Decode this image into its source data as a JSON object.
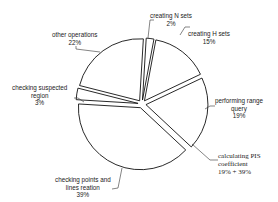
{
  "chart_data": {
    "type": "pie",
    "title": "",
    "style": "exploded, unfilled slices with black outlines",
    "slices": [
      {
        "label": "creating N sets",
        "value": 2,
        "display": "2%"
      },
      {
        "label": "creating H sets",
        "value": 15,
        "display": "15%"
      },
      {
        "label": "performing range query",
        "value": 19,
        "display": "19%"
      },
      {
        "label": "checking points and lines reation",
        "value": 39,
        "display": "39%"
      },
      {
        "label": "checking suspected region",
        "value": 3,
        "display": "3%"
      },
      {
        "label": "other operations",
        "value": 22,
        "display": "22%"
      }
    ],
    "annotations": [
      {
        "text": "calculating PIS coefficient",
        "value_text": "19% + 39%",
        "points_to": "boundary between performing range query and checking points and lines reation"
      }
    ]
  },
  "labels": {
    "n_sets": {
      "line1": "creating N sets",
      "line2": "2%"
    },
    "h_sets": {
      "line1": "creating H sets",
      "line2": "15%"
    },
    "range": {
      "line1": "performing range",
      "line2": "query",
      "line3": "19%"
    },
    "pis": {
      "line1": "calculating PIS",
      "line2": "coefficient",
      "line3": "19% + 39%"
    },
    "points": {
      "line1": "checking points and",
      "line2": "lines reation",
      "line3": "39%"
    },
    "suspected": {
      "line1": "checking suspected",
      "line2": "region",
      "line3": "3%"
    },
    "other": {
      "line1": "other operations",
      "line2": "22%"
    }
  },
  "colors": {
    "stroke": "#111111",
    "fill": "#ffffff",
    "leader": "#333333"
  }
}
